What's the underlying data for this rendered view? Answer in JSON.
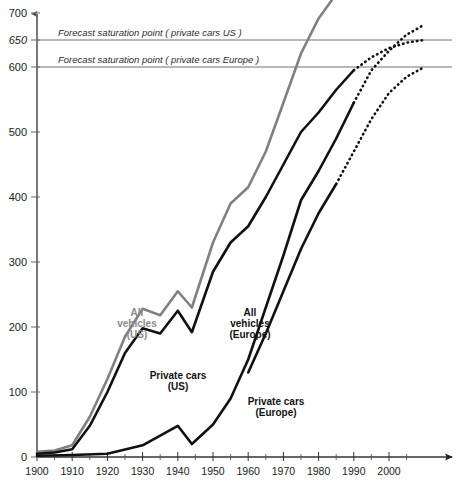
{
  "chart_data": {
    "type": "line",
    "title": "",
    "subtitle": "",
    "xlabel": "",
    "ylabel": "",
    "xlim": [
      1900,
      2010
    ],
    "ylim": [
      0,
      875
    ],
    "grid": false,
    "legend_position": "inline-labels",
    "x_ticks": [
      "1900",
      "1910",
      "1920",
      "1930",
      "1940",
      "1950",
      "1960",
      "1970",
      "1980",
      "1990",
      "2000"
    ],
    "x_tick_values": [
      1900,
      1910,
      1920,
      1930,
      1940,
      1950,
      1960,
      1970,
      1980,
      1990,
      2000
    ],
    "x_minor_tick_values": [
      1905,
      1915,
      1925,
      1935,
      1945,
      1955,
      1965,
      1975,
      1985,
      1995,
      2005
    ],
    "y_ticks": [
      "0",
      "100",
      "200",
      "300",
      "400",
      "500",
      "600",
      "650",
      "700",
      "750",
      "800",
      "850"
    ],
    "y_tick_values": [
      0,
      100,
      200,
      300,
      400,
      500,
      600,
      650,
      700,
      750,
      800,
      850
    ],
    "y_italic_ticks": [
      650,
      750,
      850
    ],
    "saturation_lines": [
      {
        "label": "Forecast saturation point ( all vehicles US )",
        "value": 850
      },
      {
        "label": "Forecast saturation point ( all vehicles Europe )",
        "value": 750
      },
      {
        "label": "Forecast saturation point ( private cars US )",
        "value": 650
      },
      {
        "label": "Forecast saturation point ( private cars Europe )",
        "value": 600
      }
    ],
    "series": [
      {
        "name": "All vehicles (US)",
        "label_lines": [
          "All",
          "vehicles",
          "(US)"
        ],
        "color": "#808080",
        "style": "solid",
        "historic_x": [
          1900,
          1905,
          1910,
          1915,
          1920,
          1925,
          1930,
          1935,
          1940,
          1944,
          1950,
          1955,
          1960,
          1965,
          1970,
          1975,
          1980,
          1985,
          1990
        ],
        "historic_values": [
          8,
          10,
          18,
          62,
          120,
          185,
          228,
          218,
          255,
          230,
          330,
          390,
          415,
          470,
          545,
          625,
          690,
          735,
          755
        ],
        "forecast_x": [
          1990,
          1995,
          2000,
          2005,
          2008
        ],
        "forecast_values": [
          755,
          800,
          830,
          845,
          850
        ]
      },
      {
        "name": "Private cars (US)",
        "label_lines": [
          "Private cars",
          "(US)"
        ],
        "color": "#111111",
        "style": "solid",
        "historic_x": [
          1900,
          1905,
          1910,
          1915,
          1920,
          1925,
          1930,
          1935,
          1940,
          1944,
          1950,
          1955,
          1960,
          1965,
          1970,
          1975,
          1980,
          1985,
          1990
        ],
        "historic_values": [
          5,
          7,
          12,
          48,
          100,
          160,
          198,
          190,
          225,
          192,
          285,
          330,
          355,
          400,
          450,
          500,
          530,
          565,
          595
        ],
        "forecast_x": [
          1990,
          1995,
          2000,
          2005,
          2010
        ],
        "forecast_values": [
          595,
          618,
          635,
          645,
          650
        ]
      },
      {
        "name": "All vehicles (Europe)",
        "label_lines": [
          "All",
          "vehicles",
          "(Europe)"
        ],
        "color": "#111111",
        "style": "solid",
        "historic_x": [
          1900,
          1910,
          1920,
          1930,
          1940,
          1944,
          1950,
          1955,
          1960,
          1965,
          1970,
          1975,
          1980,
          1985,
          1990
        ],
        "historic_values": [
          2,
          3,
          5,
          18,
          48,
          20,
          50,
          90,
          150,
          230,
          310,
          395,
          440,
          490,
          545
        ],
        "forecast_x": [
          1990,
          1995,
          2000,
          2005,
          2010
        ],
        "forecast_values": [
          545,
          595,
          630,
          660,
          678
        ]
      },
      {
        "name": "Private cars (Europe)",
        "label_lines": [
          "Private cars",
          "(Europe)"
        ],
        "color": "#111111",
        "style": "solid",
        "historic_x": [
          1960,
          1965,
          1970,
          1975,
          1980,
          1985
        ],
        "historic_values": [
          130,
          190,
          255,
          320,
          375,
          420
        ],
        "forecast_x": [
          1985,
          1990,
          1995,
          2000,
          2005,
          2010
        ],
        "forecast_values": [
          420,
          470,
          520,
          560,
          585,
          600
        ]
      }
    ]
  },
  "series_label_positions": [
    {
      "key": "us-all",
      "x": 137,
      "y": 316
    },
    {
      "key": "us-cars",
      "x": 178,
      "y": 379
    },
    {
      "key": "eu-all",
      "x": 250,
      "y": 316
    },
    {
      "key": "eu-cars",
      "x": 276,
      "y": 405
    }
  ]
}
